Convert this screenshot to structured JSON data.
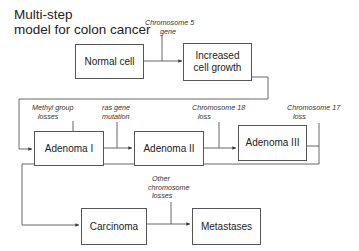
{
  "diagram": {
    "title_line1": "Multi-step",
    "title_line2": "model for colon cancer",
    "nodes": {
      "normal_cell": "Normal cell",
      "increased_growth_line1": "Increased",
      "increased_growth_line2": "cell growth",
      "adenoma_1": "Adenoma I",
      "adenoma_2": "Adenoma II",
      "adenoma_3": "Adenoma III",
      "carcinoma": "Carcinoma",
      "metastases": "Metastases"
    },
    "events": {
      "chr5_line1": "Chromosome 5",
      "chr5_line2": "gene",
      "methyl_line1": "Methyl group",
      "methyl_line2": "losses",
      "ras_line1": "ras gene",
      "ras_line2": "mutation",
      "chr18_line1": "Chromosome 18",
      "chr18_line2": "loss",
      "chr17_line1": "Chromosome 17",
      "chr17_line2": "loss",
      "other_line1": "Other",
      "other_line2": "chromosome",
      "other_line3": "losses"
    },
    "colors": {
      "line": "#555555",
      "text": "#222222",
      "background": "#ffffff"
    }
  }
}
